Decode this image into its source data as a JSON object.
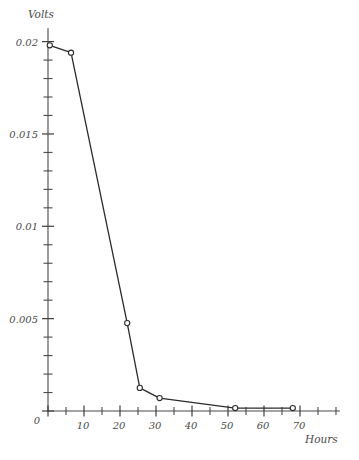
{
  "chart_data": {
    "type": "line",
    "title": "",
    "xlabel": "Hours",
    "ylabel": "Volts",
    "xlim": [
      0,
      81
    ],
    "ylim": [
      0,
      0.0207
    ],
    "grid": false,
    "legend": null,
    "x_ticks_major": [
      0,
      10,
      20,
      30,
      40,
      50,
      60,
      70
    ],
    "x_tick_labels": [
      "0",
      "10",
      "20",
      "30",
      "40",
      "50",
      "60",
      "70"
    ],
    "x_ticks_minor": [
      5,
      15,
      25,
      35,
      45,
      55,
      65,
      75,
      80
    ],
    "y_ticks_major": [
      0,
      0.005,
      0.01,
      0.015,
      0.02
    ],
    "y_tick_labels": [
      "0",
      "0.005",
      "0.01",
      "0.015",
      "0.02"
    ],
    "y_ticks_minor": [
      0.001,
      0.002,
      0.003,
      0.004,
      0.006,
      0.007,
      0.008,
      0.009,
      0.011,
      0.012,
      0.013,
      0.014,
      0.016,
      0.017,
      0.018,
      0.019
    ],
    "series": [
      {
        "name": "Volts",
        "marker": "open-circle",
        "x": [
          0.5,
          6.4,
          22,
          25.5,
          31,
          52,
          68
        ],
        "y": [
          0.0198,
          0.0194,
          0.00476,
          0.00125,
          0.0007,
          0.00016,
          0.00016
        ]
      }
    ]
  },
  "axis_titles": {
    "y": "Volts",
    "x": "Hours"
  }
}
